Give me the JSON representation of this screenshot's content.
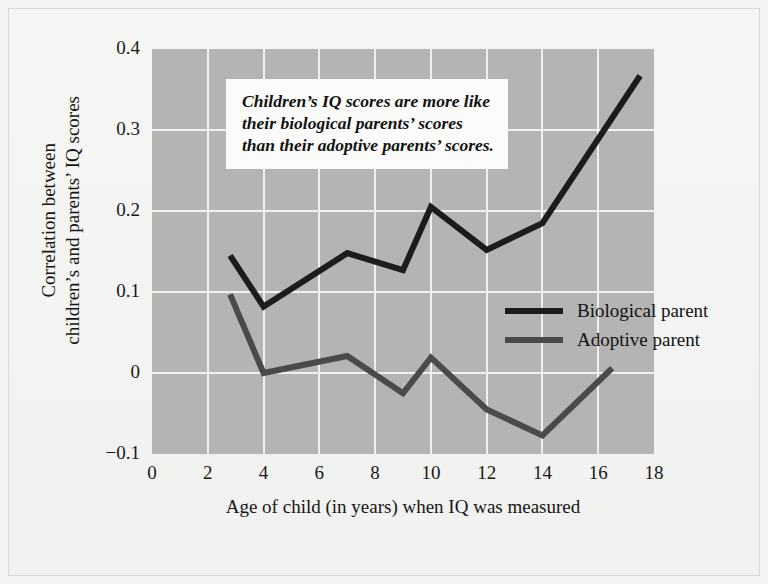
{
  "chart_data": {
    "type": "line",
    "title": "",
    "xlabel": "Age of child (in years) when IQ was measured",
    "ylabel_line1": "Correlation between",
    "ylabel_line2": "children’s and parents’ IQ scores",
    "xlim": [
      0,
      18
    ],
    "ylim": [
      -0.1,
      0.4
    ],
    "xticks": [
      "0",
      "2",
      "4",
      "6",
      "8",
      "10",
      "12",
      "14",
      "16",
      "18"
    ],
    "xtick_values": [
      0,
      2,
      4,
      6,
      8,
      10,
      12,
      14,
      16,
      18
    ],
    "yticks": [
      "0.4",
      "0.3",
      "0.2",
      "0.1",
      "0",
      "−0.1"
    ],
    "ytick_values": [
      0.4,
      0.3,
      0.2,
      0.1,
      0,
      -0.1
    ],
    "grid": true,
    "legend_position": "center-right inside plot",
    "plot_background": "#b4b4b4",
    "gridline_color": "#f0f0ee",
    "series": [
      {
        "name": "Biological parent",
        "color": "#1c1c1c",
        "x": [
          2.8,
          4,
          7,
          9,
          10,
          12,
          14,
          17.5
        ],
        "values": [
          0.145,
          0.082,
          0.148,
          0.127,
          0.205,
          0.152,
          0.185,
          0.367
        ]
      },
      {
        "name": "Adoptive parent",
        "color": "#4a4a4a",
        "x": [
          2.8,
          4,
          7,
          9,
          10,
          12,
          14,
          16.5
        ],
        "values": [
          0.097,
          0.0,
          0.021,
          -0.025,
          0.019,
          -0.045,
          -0.077,
          0.006
        ]
      }
    ],
    "annotations": [
      {
        "name": "callout",
        "text": "Children’s IQ scores are more like their biological parents’ scores than their adoptive parents’ scores."
      }
    ]
  },
  "legend": {
    "items": [
      {
        "label": "Biological parent",
        "color": "#1c1c1c"
      },
      {
        "label": "Adoptive parent",
        "color": "#4a4a4a"
      }
    ]
  }
}
